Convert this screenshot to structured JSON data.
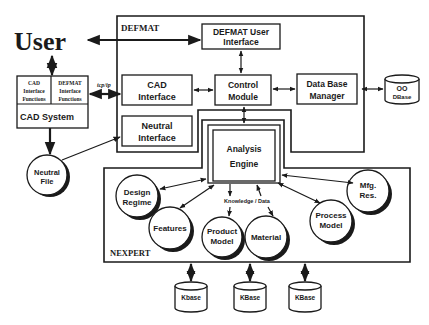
{
  "diagram": {
    "user_label": "User",
    "defmat_frame": {
      "label": "DEFMAT"
    },
    "nexpert_frame": {
      "label": "NEXPERT"
    },
    "cad_system": {
      "left_cell": [
        "CAD",
        "Interface",
        "Functions"
      ],
      "right_cell": [
        "DEFMAT",
        "Interface",
        "Functions"
      ],
      "bottom_label": "CAD System"
    },
    "link_label": "tcp/ip",
    "boxes": {
      "defmat_user_interface": [
        "DEFMAT User",
        "Interface"
      ],
      "cad_interface": [
        "CAD",
        "Interface"
      ],
      "neutral_interface": [
        "Neutral",
        "Interface"
      ],
      "control_module": [
        "Control",
        "Module"
      ],
      "data_base_manager": [
        "Data Base",
        "Manager"
      ],
      "analysis_engine": [
        "Analysis",
        "Engine"
      ]
    },
    "databases": {
      "oo_dbase": [
        "OO",
        "DBase"
      ],
      "kbase_1": "Kbase",
      "kbase_2": "KBase",
      "kbase_3": "KBase"
    },
    "circles": {
      "neutral_file": [
        "Neutral",
        "File"
      ],
      "design_regime": [
        "Design",
        "Regime"
      ],
      "features": [
        "Features"
      ],
      "product_model": [
        "Product",
        "Model"
      ],
      "material": [
        "Material"
      ],
      "process_model": [
        "Process",
        "Model"
      ],
      "mfg_res": [
        "Mfg.",
        "Res."
      ]
    },
    "annotation": "Knowledge / Data",
    "colors": {
      "ink": "#1a1a1a",
      "background": "#ffffff"
    }
  }
}
